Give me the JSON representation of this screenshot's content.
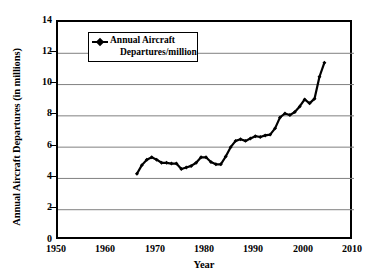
{
  "chart_data": {
    "type": "line",
    "title": "",
    "xlabel": "Year",
    "ylabel": "Annual Aircraft Departures (in millions)",
    "xlim": [
      1950,
      2010
    ],
    "ylim": [
      0,
      14
    ],
    "xticks": [
      1950,
      1960,
      1970,
      1980,
      1990,
      2000,
      2010
    ],
    "yticks": [
      0,
      2,
      4,
      6,
      8,
      10,
      12,
      14
    ],
    "grid": "horizontal",
    "legend_position": "upper-left-inside",
    "legend_entries": [
      "Annual Aircraft Departures/million"
    ],
    "series": [
      {
        "name": "Annual Aircraft Departures/million",
        "marker": "diamond",
        "color": "#000000",
        "x": [
          1966,
          1967,
          1968,
          1969,
          1970,
          1971,
          1972,
          1973,
          1974,
          1975,
          1976,
          1977,
          1978,
          1979,
          1980,
          1981,
          1982,
          1983,
          1984,
          1985,
          1986,
          1987,
          1988,
          1989,
          1990,
          1991,
          1992,
          1993,
          1994,
          1995,
          1996,
          1997,
          1998,
          1999,
          2000,
          2001,
          2002,
          2003,
          2004
        ],
        "values": [
          4.3,
          4.85,
          5.2,
          5.35,
          5.2,
          5.0,
          5.0,
          4.95,
          4.95,
          4.6,
          4.7,
          4.8,
          5.0,
          5.35,
          5.35,
          5.05,
          4.9,
          4.9,
          5.4,
          6.0,
          6.4,
          6.5,
          6.4,
          6.55,
          6.7,
          6.65,
          6.75,
          6.8,
          7.2,
          7.9,
          8.15,
          8.05,
          8.25,
          8.6,
          9.05,
          8.8,
          9.1,
          10.5,
          11.4
        ]
      }
    ]
  },
  "axes": {
    "y_title": "Annual Aircraft Departures (in millions)",
    "x_title": "Year",
    "y_tick_labels": [
      "14",
      "12",
      "10",
      "8",
      "6",
      "4",
      "2",
      "0"
    ],
    "x_tick_labels": [
      "1950",
      "1960",
      "1970",
      "1980",
      "1990",
      "2000",
      "2010"
    ]
  },
  "legend": {
    "line1": "Annual Aircraft",
    "line2": "Departures/million",
    "symbol": "line-with-diamond-marker-icon"
  },
  "colors": {
    "series": "#000000",
    "grid": "#808080",
    "frame": "#000000",
    "background": "#ffffff"
  }
}
